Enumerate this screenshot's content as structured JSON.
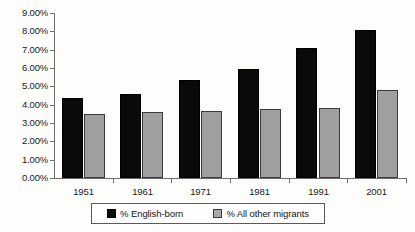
{
  "chart_data": {
    "type": "bar",
    "title": "",
    "subtitle": "",
    "xlabel": "",
    "ylabel": "",
    "categories": [
      "1951",
      "1961",
      "1971",
      "1981",
      "1991",
      "2001"
    ],
    "series": [
      {
        "name": "% English-born",
        "color": "#000000",
        "values": [
          4.35,
          4.6,
          5.35,
          5.95,
          7.1,
          8.1
        ]
      },
      {
        "name": "% All other migrants",
        "color": "#a0a0a0",
        "values": [
          3.5,
          3.6,
          3.65,
          3.75,
          3.8,
          4.8
        ]
      }
    ],
    "ylim": [
      0,
      9
    ],
    "ytick_values": [
      0,
      1,
      2,
      3,
      4,
      5,
      6,
      7,
      8,
      9
    ],
    "ytick_labels": [
      "0.00%",
      "1.00%",
      "2.00%",
      "3.00%",
      "4.00%",
      "5.00%",
      "6.00%",
      "7.00%",
      "8.00%",
      "9.00%"
    ],
    "grid": false,
    "legend_position": "bottom"
  },
  "legend": {
    "items": [
      {
        "label": "% English-born",
        "swatch": "black-square-icon"
      },
      {
        "label": "% All other migrants",
        "swatch": "gray-square-icon"
      }
    ]
  }
}
